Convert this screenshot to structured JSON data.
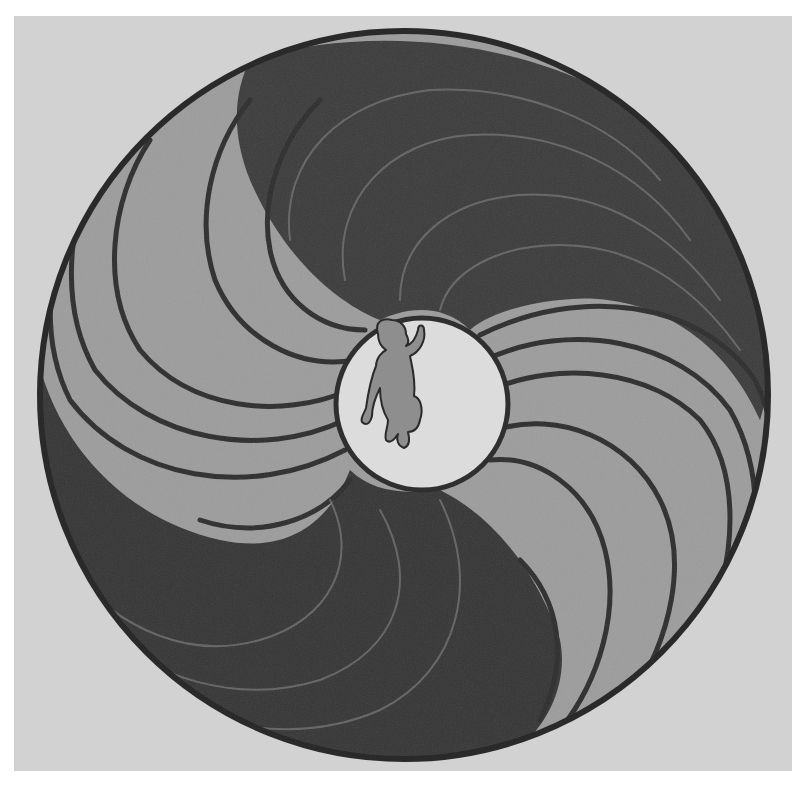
{
  "artwork": {
    "description": "Circular swirl painting with a baby figure in the center",
    "subject": "infant silhouette",
    "colors": {
      "frame_white": "#ffffff",
      "paper": "#d2d2d2",
      "dark_lobe": "#3a3a3a",
      "light_lobe": "#9a9a9a",
      "outline": "#2a2a2a",
      "center_disc": "#dedede",
      "baby_fill": "#8e8e8e"
    }
  }
}
